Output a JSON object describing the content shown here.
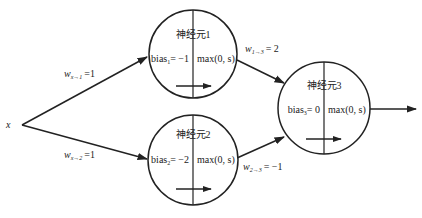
{
  "input": {
    "label": "x"
  },
  "neurons": [
    {
      "id": "1",
      "title": "神经元1",
      "bias_name": "bias",
      "bias_sub": "1",
      "bias_value": "= −1",
      "activation": "max(0, s)"
    },
    {
      "id": "2",
      "title": "神经元2",
      "bias_name": "bias",
      "bias_sub": "2",
      "bias_value": "= −2",
      "activation": "max(0, s)"
    },
    {
      "id": "3",
      "title": "神经元3",
      "bias_name": "bias",
      "bias_sub": "3",
      "bias_value": "= 0",
      "activation": "max(0, s)"
    }
  ],
  "weights": [
    {
      "from": "x",
      "to": "1",
      "name": "w",
      "sub": "x→1",
      "value": "=1"
    },
    {
      "from": "x",
      "to": "2",
      "name": "w",
      "sub": "x→2",
      "value": "=1"
    },
    {
      "from": "1",
      "to": "3",
      "name": "w",
      "sub": "1→3",
      "value": "= 2"
    },
    {
      "from": "2",
      "to": "3",
      "name": "w",
      "sub": "2→3",
      "value": "= −1"
    }
  ],
  "colors": {
    "stroke": "#222222",
    "background": "#ffffff"
  }
}
